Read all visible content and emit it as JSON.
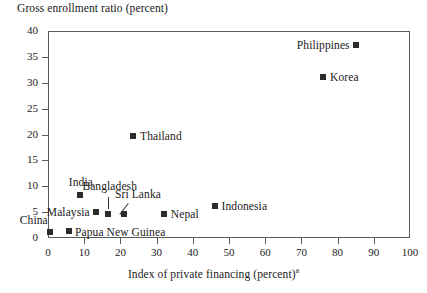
{
  "chart_data": {
    "type": "scatter",
    "title": "",
    "ylabel": "Gross enrollment ratio (percent)",
    "xlabel": "Index of private financing (percent)",
    "xlabel_superscript": "a",
    "xlim": [
      0,
      100
    ],
    "ylim": [
      0,
      40
    ],
    "xticks": [
      "0",
      "10",
      "20",
      "30",
      "40",
      "50",
      "60",
      "70",
      "80",
      "90",
      "100"
    ],
    "yticks": [
      "0",
      "5",
      "10",
      "15",
      "20",
      "25",
      "30",
      "35",
      "40"
    ],
    "grid": false,
    "legend": "none",
    "marker_color": "#2b2b2b",
    "marker_shape": "square",
    "points": [
      {
        "name": "China",
        "x": 0.5,
        "y": 1.2,
        "label_pos": "above"
      },
      {
        "name": "Papua New Guinea",
        "x": 5.8,
        "y": 1.4,
        "label_pos": "right"
      },
      {
        "name": "India",
        "x": 8.8,
        "y": 8.3,
        "label_pos": "above"
      },
      {
        "name": "Malaysia",
        "x": 13.2,
        "y": 5.1,
        "label_pos": "left"
      },
      {
        "name": "Bangladesh",
        "x": 16.5,
        "y": 4.7,
        "label_pos": "above"
      },
      {
        "name": "Sri Lanka",
        "x": 21.0,
        "y": 4.7,
        "label_pos": "above"
      },
      {
        "name": "Thailand",
        "x": 23.5,
        "y": 19.7,
        "label_pos": "right"
      },
      {
        "name": "Nepal",
        "x": 32.0,
        "y": 4.7,
        "label_pos": "right"
      },
      {
        "name": "Indonesia",
        "x": 46.0,
        "y": 6.2,
        "label_pos": "right"
      },
      {
        "name": "Korea",
        "x": 76.0,
        "y": 31.2,
        "label_pos": "right"
      },
      {
        "name": "Philippines",
        "x": 85.0,
        "y": 37.3,
        "label_pos": "left"
      }
    ]
  }
}
